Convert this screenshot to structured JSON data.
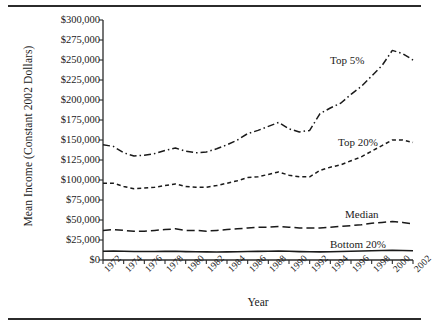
{
  "chart_data": {
    "type": "line",
    "title": "",
    "xlabel": "Year",
    "ylabel": "Mean Income (Constant 2002 Dollars)",
    "xlim": [
      1972,
      2002
    ],
    "ylim": [
      0,
      300000
    ],
    "ytick_step": 25000,
    "xtick_step": 2,
    "grid": false,
    "legend": "inline-annotations",
    "ytick_labels": [
      "$0",
      "$25,000",
      "$50,000",
      "$75,000",
      "$100,000",
      "$125,000",
      "$150,000",
      "$175,000",
      "$200,000",
      "$225,000",
      "$250,000",
      "$275,000",
      "$300,000"
    ],
    "ytick_values": [
      0,
      25000,
      50000,
      75000,
      100000,
      125000,
      150000,
      175000,
      200000,
      225000,
      250000,
      275000,
      300000
    ],
    "xtick_labels": [
      "1972",
      "1974",
      "1976",
      "1978",
      "1980",
      "1982",
      "1984",
      "1986",
      "1988",
      "1990",
      "1992",
      "1994",
      "1996",
      "1998",
      "2000",
      "2002"
    ],
    "xtick_values": [
      1972,
      1974,
      1976,
      1978,
      1980,
      1982,
      1984,
      1986,
      1988,
      1990,
      1992,
      1994,
      1996,
      1998,
      2000,
      2002
    ],
    "x": [
      1972,
      1973,
      1974,
      1975,
      1976,
      1977,
      1978,
      1979,
      1980,
      1981,
      1982,
      1983,
      1984,
      1985,
      1986,
      1987,
      1988,
      1989,
      1990,
      1991,
      1992,
      1993,
      1994,
      1995,
      1996,
      1997,
      1998,
      1999,
      2000,
      2001,
      2002
    ],
    "series": [
      {
        "name": "Top 5%",
        "dash": "dash-dot",
        "annotation": "Top 5%",
        "values": [
          144000,
          142000,
          134000,
          130000,
          131000,
          133000,
          137000,
          140000,
          136000,
          134000,
          135000,
          139000,
          144000,
          150000,
          158000,
          162000,
          167000,
          172000,
          164000,
          160000,
          162000,
          183000,
          190000,
          196000,
          207000,
          217000,
          230000,
          243000,
          262000,
          258000,
          250000
        ]
      },
      {
        "name": "Top 20%",
        "dash": "short-dash",
        "annotation": "Top 20%",
        "values": [
          96000,
          96000,
          92000,
          89000,
          90000,
          91000,
          93000,
          95000,
          92000,
          91000,
          91000,
          93000,
          96000,
          99000,
          103000,
          104000,
          107000,
          110000,
          106000,
          104000,
          104000,
          112000,
          116000,
          119000,
          124000,
          129000,
          136000,
          143000,
          150000,
          150000,
          147000
        ]
      },
      {
        "name": "Median",
        "dash": "long-dash",
        "annotation": "Median",
        "values": [
          37000,
          38000,
          37000,
          36000,
          36000,
          37000,
          38000,
          39000,
          37000,
          37000,
          36000,
          37000,
          38000,
          39000,
          40000,
          41000,
          41000,
          42000,
          41000,
          40000,
          40000,
          40000,
          41000,
          42000,
          43000,
          44000,
          46000,
          47000,
          48000,
          47000,
          45000
        ]
      },
      {
        "name": "Bottom 20%",
        "dash": "solid",
        "annotation": "Bottom 20%",
        "values": [
          11000,
          11200,
          11000,
          10600,
          10600,
          10600,
          10800,
          10900,
          10500,
          10300,
          10100,
          10000,
          10200,
          10400,
          10600,
          10800,
          10900,
          11200,
          10900,
          10500,
          10300,
          10200,
          10400,
          10700,
          10900,
          11200,
          11600,
          11900,
          12100,
          11900,
          11500
        ]
      }
    ]
  }
}
